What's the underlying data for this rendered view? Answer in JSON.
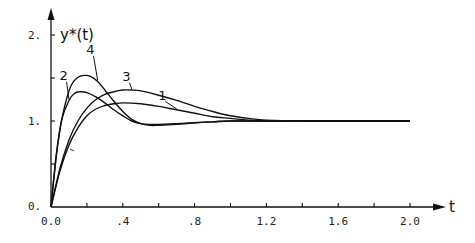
{
  "chart_data": {
    "type": "line",
    "title": "",
    "xlabel": "t",
    "ylabel": "y*(t)",
    "xlim": [
      0.0,
      2.0
    ],
    "ylim": [
      0.0,
      2.0
    ],
    "grid": false,
    "legend": "inline numeric labels 1-4 with leader lines",
    "x_ticks": [
      0.0,
      0.2,
      0.4,
      0.6,
      0.8,
      1.0,
      1.2,
      1.4,
      1.6,
      1.8,
      2.0
    ],
    "x_tick_labels": [
      {
        "value": 0.0,
        "label": "0.0"
      },
      {
        "value": 0.4,
        "label": ".4"
      },
      {
        "value": 0.8,
        "label": ".8"
      },
      {
        "value": 1.2,
        "label": "1.2"
      },
      {
        "value": 1.6,
        "label": "1.6"
      },
      {
        "value": 2.0,
        "label": "2.0"
      }
    ],
    "y_ticks": [
      0.0,
      0.5,
      1.0,
      1.5,
      2.0
    ],
    "y_tick_labels": [
      {
        "value": 0.0,
        "label": "0."
      },
      {
        "value": 1.0,
        "label": "1."
      },
      {
        "value": 2.0,
        "label": "2."
      }
    ],
    "series": [
      {
        "name": "1",
        "x": [
          0.0,
          0.05,
          0.1,
          0.15,
          0.2,
          0.25,
          0.3,
          0.35,
          0.4,
          0.5,
          0.6,
          0.7,
          0.8,
          0.9,
          1.0,
          1.1,
          1.2,
          1.4,
          1.6,
          1.8,
          2.0
        ],
        "y": [
          0.0,
          0.42,
          0.72,
          0.92,
          1.06,
          1.14,
          1.18,
          1.2,
          1.21,
          1.2,
          1.17,
          1.13,
          1.09,
          1.05,
          1.03,
          1.01,
          1.0,
          1.0,
          1.0,
          1.0,
          1.0
        ],
        "label_pos": {
          "t": 0.62,
          "y": 1.25
        }
      },
      {
        "name": "2",
        "x": [
          0.0,
          0.03,
          0.06,
          0.1,
          0.13,
          0.16,
          0.2,
          0.25,
          0.3,
          0.35,
          0.4,
          0.45,
          0.5,
          0.55,
          0.6,
          0.7,
          0.8,
          0.9,
          1.0,
          1.2,
          1.6,
          2.0
        ],
        "y": [
          0.0,
          0.62,
          1.02,
          1.24,
          1.32,
          1.34,
          1.33,
          1.28,
          1.21,
          1.13,
          1.06,
          1.0,
          0.97,
          0.96,
          0.96,
          0.97,
          0.98,
          0.99,
          1.0,
          1.0,
          1.0,
          1.0
        ],
        "label_pos": {
          "t": 0.07,
          "y": 1.48
        }
      },
      {
        "name": "3",
        "x": [
          0.0,
          0.05,
          0.1,
          0.15,
          0.2,
          0.25,
          0.3,
          0.35,
          0.4,
          0.45,
          0.5,
          0.6,
          0.7,
          0.8,
          0.9,
          1.0,
          1.1,
          1.2,
          1.4,
          1.6,
          1.8,
          2.0
        ],
        "y": [
          0.0,
          0.45,
          0.78,
          1.0,
          1.15,
          1.25,
          1.31,
          1.34,
          1.36,
          1.36,
          1.35,
          1.3,
          1.24,
          1.17,
          1.11,
          1.06,
          1.03,
          1.01,
          1.0,
          1.0,
          1.0,
          1.0
        ],
        "label_pos": {
          "t": 0.42,
          "y": 1.47
        }
      },
      {
        "name": "4",
        "x": [
          0.0,
          0.03,
          0.06,
          0.1,
          0.13,
          0.16,
          0.19,
          0.22,
          0.26,
          0.3,
          0.35,
          0.4,
          0.45,
          0.5,
          0.55,
          0.6,
          0.7,
          0.8,
          0.9,
          1.0,
          1.2,
          1.6,
          2.0
        ],
        "y": [
          0.0,
          0.6,
          1.02,
          1.35,
          1.47,
          1.52,
          1.53,
          1.52,
          1.46,
          1.36,
          1.23,
          1.11,
          1.02,
          0.97,
          0.95,
          0.95,
          0.96,
          0.98,
          0.99,
          1.0,
          1.0,
          1.0,
          1.0
        ],
        "label_pos": {
          "t": 0.22,
          "y": 1.78
        }
      }
    ]
  },
  "labels": {
    "ylabel": "y*(t)",
    "xlabel": "t"
  }
}
